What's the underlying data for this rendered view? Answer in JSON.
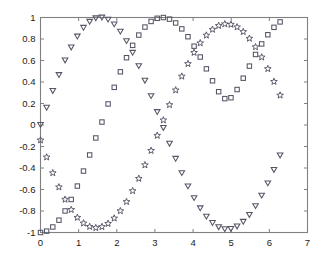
{
  "chart_data": {
    "type": "scatter",
    "title": "",
    "subtitle": "",
    "xlabel": "",
    "ylabel": "",
    "xlim": [
      0,
      7
    ],
    "ylim": [
      -1,
      1
    ],
    "grid": false,
    "legend": "none",
    "background_color": "#ffffff",
    "axis_color": "#808080",
    "marker_color": "#555566",
    "xticks": [
      0,
      1,
      2,
      3,
      4,
      5,
      6,
      7
    ],
    "xticklabels": [
      "0",
      "1",
      "2",
      "3",
      "4",
      "5",
      "6",
      "7"
    ],
    "yticks": [
      -1,
      -0.8,
      -0.6,
      -0.4,
      -0.2,
      0,
      0.2,
      0.4,
      0.6,
      0.8,
      1
    ],
    "yticklabels": [
      "-1",
      "-0.8",
      "-0.6",
      "-0.4",
      "-0.2",
      "0",
      "0.2",
      "0.4",
      "0.6",
      "0.8",
      "1"
    ],
    "x": [
      0,
      0.1611,
      0.3221,
      0.4832,
      0.6443,
      0.8054,
      0.9664,
      1.1275,
      1.2886,
      1.4496,
      1.6107,
      1.7718,
      1.9329,
      2.0939,
      2.255,
      2.4161,
      2.5771,
      2.7382,
      2.8993,
      3.0604,
      3.2214,
      3.3825,
      3.5436,
      3.7046,
      3.8657,
      4.0268,
      4.1879,
      4.3489,
      4.51,
      4.6711,
      4.8321,
      4.9932,
      5.1543,
      5.3154,
      5.4764,
      5.6375,
      5.7986,
      5.9596,
      6.1207,
      6.2818
    ],
    "series": [
      {
        "name": "sin(x)",
        "marker": "triangle-down",
        "values": [
          0,
          0.1604,
          0.3166,
          0.4647,
          0.6006,
          0.7212,
          0.823,
          0.9042,
          0.9603,
          0.9927,
          0.9996,
          0.9806,
          0.9366,
          0.869,
          0.7798,
          0.6717,
          0.5479,
          0.4122,
          0.2684,
          0.1205,
          -0.0272,
          -0.1737,
          -0.3144,
          -0.4478,
          -0.5707,
          -0.6802,
          -0.7747,
          -0.8526,
          -0.9115,
          -0.9508,
          -0.9696,
          -0.9673,
          -0.944,
          -0.9002,
          -0.8367,
          -0.7549,
          -0.6564,
          -0.5433,
          -0.4179,
          -0.2832
        ]
      },
      {
        "name": "-cos(x)",
        "marker": "square",
        "values": [
          -1,
          -0.9871,
          -0.9486,
          -0.8854,
          -0.7995,
          -0.6927,
          -0.568,
          -0.4284,
          -0.2789,
          -0.1206,
          0.0276,
          0.1959,
          0.3504,
          0.4948,
          0.626,
          0.7408,
          0.8366,
          0.9111,
          0.9633,
          0.9927,
          0.9996,
          0.9848,
          0.9493,
          0.8941,
          0.8212,
          0.7331,
          0.6324,
          0.5225,
          0.4112,
          0.3098,
          0.2453,
          0.2535,
          0.33,
          0.4354,
          0.5477,
          0.656,
          0.7544,
          0.8396,
          0.9085,
          0.959
        ]
      },
      {
        "name": "sin(x + phase)",
        "marker": "pentagram",
        "values": [
          -0.1411,
          -0.2995,
          -0.4461,
          -0.578,
          -0.6925,
          -0.788,
          -0.8609,
          -0.9134,
          -0.9455,
          -0.9566,
          -0.9471,
          -0.9172,
          -0.8677,
          -0.7996,
          -0.7141,
          -0.6131,
          -0.4985,
          -0.3725,
          -0.2382,
          -0.098,
          0.0451,
          0.1872,
          0.324,
          0.4524,
          0.5696,
          0.6732,
          0.762,
          0.8342,
          0.8883,
          0.9236,
          0.9391,
          0.9349,
          0.9106,
          0.8671,
          0.8049,
          0.7256,
          0.6308,
          0.5226,
          0.4036,
          0.2762
        ]
      }
    ]
  }
}
